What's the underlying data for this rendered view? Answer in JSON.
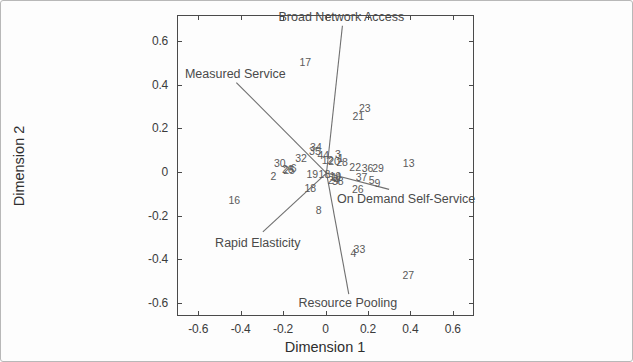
{
  "chart_data": {
    "type": "scatter",
    "title": "",
    "subtitle": "",
    "xlabel": "Dimension 1",
    "ylabel": "Dimension 2",
    "xlim": [
      -0.7,
      0.7
    ],
    "ylim": [
      -0.66,
      0.72
    ],
    "grid": false,
    "legend": "none",
    "xticks": [
      -0.6,
      -0.4,
      -0.2,
      0,
      0.2,
      0.4,
      0.6
    ],
    "xticklabels": [
      "-0.6",
      "-0.4",
      "-0.2",
      "0",
      "0.2",
      "0.4",
      "0.6"
    ],
    "yticks": [
      -0.6,
      -0.4,
      -0.2,
      0,
      0.2,
      0.4,
      0.6
    ],
    "yticklabels": [
      "-0.6",
      "-0.4",
      "-0.2",
      "0",
      "0.2",
      "0.4",
      "0.6"
    ],
    "point_marker": "text-label",
    "points": [
      {
        "label": "17",
        "x": -0.095,
        "y": 0.505
      },
      {
        "label": "23",
        "x": 0.185,
        "y": 0.295
      },
      {
        "label": "21",
        "x": 0.155,
        "y": 0.255
      },
      {
        "label": "34",
        "x": -0.045,
        "y": 0.115
      },
      {
        "label": "35",
        "x": -0.05,
        "y": 0.095
      },
      {
        "label": "44",
        "x": -0.01,
        "y": 0.08
      },
      {
        "label": "32",
        "x": -0.115,
        "y": 0.065
      },
      {
        "label": "12",
        "x": 0.01,
        "y": 0.055
      },
      {
        "label": "20",
        "x": 0.04,
        "y": 0.05
      },
      {
        "label": "3",
        "x": 0.058,
        "y": 0.082
      },
      {
        "label": "1",
        "x": 0.072,
        "y": 0.065
      },
      {
        "label": "28",
        "x": 0.078,
        "y": 0.048
      },
      {
        "label": "30",
        "x": -0.215,
        "y": 0.042
      },
      {
        "label": "6",
        "x": -0.15,
        "y": 0.018
      },
      {
        "label": "25",
        "x": -0.172,
        "y": 0.008
      },
      {
        "label": "26",
        "x": -0.178,
        "y": 0.012
      },
      {
        "label": "22",
        "x": 0.14,
        "y": 0.022
      },
      {
        "label": "36",
        "x": 0.198,
        "y": 0.018
      },
      {
        "label": "29",
        "x": 0.248,
        "y": 0.02
      },
      {
        "label": "13",
        "x": 0.392,
        "y": 0.042
      },
      {
        "label": "19",
        "x": -0.062,
        "y": -0.01
      },
      {
        "label": "18",
        "x": -0.005,
        "y": -0.01
      },
      {
        "label": "2",
        "x": -0.245,
        "y": -0.018
      },
      {
        "label": "10",
        "x": 0.046,
        "y": -0.018
      },
      {
        "label": "11",
        "x": 0.052,
        "y": -0.022
      },
      {
        "label": "24",
        "x": 0.038,
        "y": -0.035
      },
      {
        "label": "38",
        "x": 0.058,
        "y": -0.04
      },
      {
        "label": "37",
        "x": 0.17,
        "y": -0.022
      },
      {
        "label": "5",
        "x": 0.218,
        "y": -0.035
      },
      {
        "label": "9",
        "x": 0.245,
        "y": -0.05
      },
      {
        "label": "26b",
        "x": 0.152,
        "y": -0.078,
        "display": "26"
      },
      {
        "label": "18b",
        "x": -0.072,
        "y": -0.072,
        "display": "18"
      },
      {
        "label": "16",
        "x": -0.43,
        "y": -0.128
      },
      {
        "label": "8",
        "x": -0.032,
        "y": -0.172
      },
      {
        "label": "4",
        "x": 0.132,
        "y": -0.372
      },
      {
        "label": "33",
        "x": 0.16,
        "y": -0.352
      },
      {
        "label": "27",
        "x": 0.39,
        "y": -0.47
      }
    ],
    "vectors": [
      {
        "label": "Broad Network Access",
        "x": 0.075,
        "y": 0.675,
        "label_pos": "top"
      },
      {
        "label": "Measured Service",
        "x": -0.425,
        "y": 0.415,
        "label_pos": "top"
      },
      {
        "label": "On Demand Self-Service",
        "x": 0.295,
        "y": -0.075,
        "label_pos": "bottom-right"
      },
      {
        "label": "Rapid Elasticity",
        "x": -0.3,
        "y": -0.27,
        "label_pos": "bottom-left"
      },
      {
        "label": "Resource Pooling",
        "x": 0.105,
        "y": -0.555,
        "label_pos": "bottom"
      }
    ],
    "vector_origin": {
      "x": 0.0,
      "y": 0.0
    },
    "colors": {
      "axis": "#4a4a4a",
      "vector": "#6f6f6f",
      "point_label": "#5a5a5a",
      "tick_label": "#3b3b3b",
      "background": "#fdfdfd",
      "frame": "#b8b8b8"
    }
  }
}
